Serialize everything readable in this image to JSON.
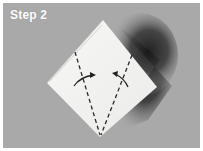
{
  "step": {
    "label": "Step 2"
  },
  "figure": {
    "colors": {
      "background": "#a9a9a9",
      "shadow": "#1e1e1e",
      "paper": "#f4f4f2",
      "lines": "#2a2a2a",
      "border": "#ffffff"
    },
    "icons": [
      "fold-arrow-right",
      "fold-arrow-left",
      "dashed-fold-line-left",
      "dashed-fold-line-right"
    ]
  }
}
